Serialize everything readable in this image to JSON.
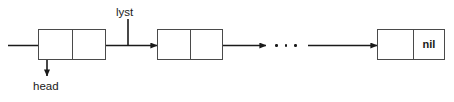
{
  "diagram": {
    "type": "linked-list",
    "title": "",
    "background_color": "#ffffff",
    "stroke_color": "#1a1a1a",
    "box_border_color": "#4a4a4a",
    "labels": {
      "head": "head",
      "lyst": "lyst",
      "nil": "nil"
    },
    "ellipsis": {
      "dot_count": 3,
      "meaning": "continuation"
    },
    "nodes": [
      {
        "id": "node-1",
        "data_cell_text": "",
        "pointer_cell_text": "",
        "x": 38,
        "y": 29,
        "width": 68,
        "height": 31,
        "data_cell_width": 34
      },
      {
        "id": "node-2",
        "data_cell_text": "",
        "pointer_cell_text": "",
        "x": 157,
        "y": 29,
        "width": 66,
        "height": 31,
        "data_cell_width": 33
      },
      {
        "id": "node-last",
        "data_cell_text": "",
        "pointer_cell_text": "nil",
        "x": 377,
        "y": 29,
        "width": 68,
        "height": 31,
        "data_cell_width": 36
      }
    ],
    "arrows": [
      {
        "id": "entry-arrow",
        "from": "left-edge",
        "to": "node-1",
        "direction": "right"
      },
      {
        "id": "head-arrow",
        "from": "node-1",
        "to": "head-label",
        "direction": "down"
      },
      {
        "id": "node1-to-node2",
        "from": "node-1",
        "to": "node-2",
        "direction": "right"
      },
      {
        "id": "node2-to-ellipsis",
        "from": "node-2",
        "to": "ellipsis",
        "direction": "right"
      },
      {
        "id": "ellipsis-to-last",
        "from": "ellipsis",
        "to": "node-last",
        "direction": "right"
      }
    ],
    "lyst_pointer": {
      "label": "lyst",
      "stem_x": 128,
      "stem_top": 19,
      "stem_bottom": 45
    }
  }
}
